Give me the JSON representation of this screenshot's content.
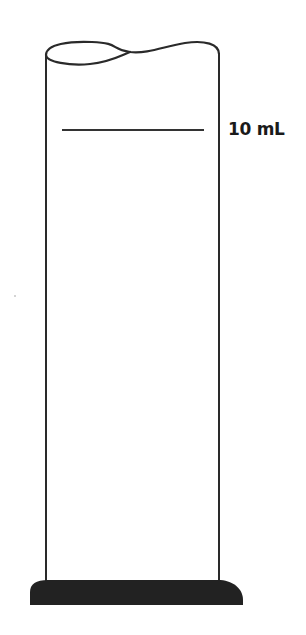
{
  "diagram": {
    "marks": [
      {
        "label": "10 mL",
        "y": 130
      }
    ],
    "colors": {
      "outline": "#2a2a2a",
      "base": "#222222",
      "background": "#ffffff"
    }
  }
}
